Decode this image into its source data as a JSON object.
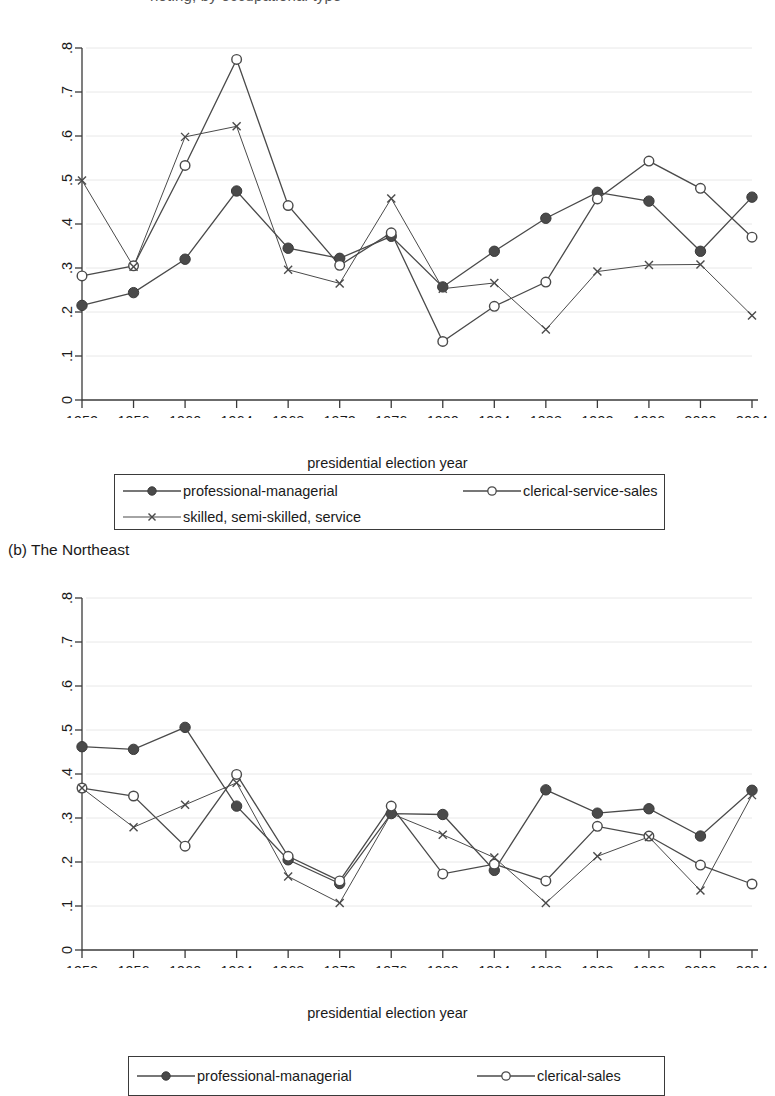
{
  "top_fragment": {
    "text": "noting, by occupational type"
  },
  "captions": {
    "figure_b": "(b) The Northeast"
  },
  "axis": {
    "x_title": "presidential election year",
    "x_ticks": [
      "1952",
      "1956",
      "1960",
      "1964",
      "1968",
      "1972",
      "1976",
      "1980",
      "1984",
      "1988",
      "1992",
      "1996",
      "2000",
      "2004"
    ],
    "y_ticks": [
      "0",
      ".1",
      ".2",
      ".3",
      ".4",
      ".5",
      ".6",
      ".7",
      ".8"
    ]
  },
  "colors": {
    "line": "#4a4a4a",
    "filled_marker": "#4a4a4a",
    "open_marker_fill": "#ffffff",
    "axis": "#3a3a3a",
    "text": "#1a1a1a",
    "grid": "#e8e8e8"
  },
  "legend_a": {
    "entries": [
      {
        "label": "professional-managerial",
        "marker": "filled-circle-icon"
      },
      {
        "label": "clerical-service-sales",
        "marker": "open-circle-icon"
      },
      {
        "label": "skilled, semi-skilled, service",
        "marker": "cross-x-icon"
      }
    ]
  },
  "legend_b": {
    "entries": [
      {
        "label": "professional-managerial",
        "marker": "filled-circle-icon"
      },
      {
        "label": "clerical-sales",
        "marker": "open-circle-icon"
      }
    ]
  },
  "chart_data": [
    {
      "id": "figure-a",
      "type": "line",
      "title": "",
      "xlabel": "presidential election year",
      "ylabel": "",
      "x": [
        1952,
        1956,
        1960,
        1964,
        1968,
        1972,
        1976,
        1980,
        1984,
        1988,
        1992,
        1996,
        2000,
        2004
      ],
      "xlim": [
        1952,
        2004
      ],
      "ylim": [
        0,
        0.8
      ],
      "grid": true,
      "legend_position": "below",
      "series": [
        {
          "name": "professional-managerial",
          "marker": "filled-circle",
          "values": [
            0.215,
            0.244,
            0.32,
            0.475,
            0.345,
            0.322,
            0.372,
            0.257,
            0.338,
            0.413,
            0.472,
            0.452,
            0.338,
            0.461
          ]
        },
        {
          "name": "clerical-service-sales",
          "marker": "open-circle",
          "values": [
            0.282,
            0.305,
            0.533,
            0.774,
            0.442,
            0.306,
            0.38,
            0.133,
            0.213,
            0.268,
            0.457,
            0.543,
            0.481,
            0.37
          ]
        },
        {
          "name": "skilled, semi-skilled, service",
          "marker": "cross-x",
          "values": [
            0.499,
            0.303,
            0.598,
            0.622,
            0.296,
            0.265,
            0.458,
            0.253,
            0.266,
            0.16,
            0.292,
            0.307,
            0.308,
            0.192
          ]
        }
      ]
    },
    {
      "id": "figure-b",
      "type": "line",
      "title": "(b) The Northeast",
      "xlabel": "presidential election year",
      "ylabel": "",
      "x": [
        1952,
        1956,
        1960,
        1964,
        1968,
        1972,
        1976,
        1980,
        1984,
        1988,
        1992,
        1996,
        2000,
        2004
      ],
      "xlim": [
        1952,
        2004
      ],
      "ylim": [
        0,
        0.8
      ],
      "grid": true,
      "legend_position": "below",
      "series": [
        {
          "name": "professional-managerial",
          "marker": "filled-circle",
          "values": [
            0.462,
            0.456,
            0.506,
            0.327,
            0.205,
            0.151,
            0.31,
            0.308,
            0.181,
            0.364,
            0.311,
            0.321,
            0.259,
            0.363
          ]
        },
        {
          "name": "clerical-sales",
          "marker": "open-circle",
          "values": [
            0.368,
            0.35,
            0.236,
            0.399,
            0.213,
            0.157,
            0.327,
            0.173,
            0.195,
            0.157,
            0.281,
            0.259,
            0.193,
            0.15
          ]
        },
        {
          "name": "skilled, semi-skilled, service",
          "marker": "cross-x",
          "values": [
            0.368,
            0.279,
            0.33,
            0.38,
            0.167,
            0.107,
            0.31,
            0.262,
            0.21,
            0.107,
            0.213,
            0.257,
            0.135,
            0.352
          ]
        }
      ]
    }
  ]
}
